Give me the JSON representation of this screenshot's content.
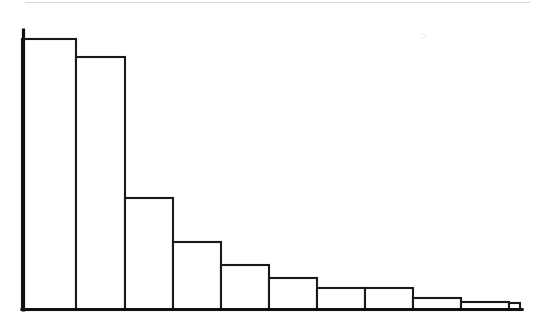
{
  "figure": {
    "title": "",
    "background_color": "#ffffff",
    "ink_color": "#1a1a1a",
    "axis_color": "#111111",
    "scan_artifact_color": "#d9d9d9",
    "width_px": 553,
    "height_px": 327
  },
  "axes": {
    "origin_x_px": 22,
    "baseline_y_px": 310,
    "y_axis_top_px": 30,
    "x_axis_right_px": 522,
    "x_axis_label": "",
    "y_axis_label": "",
    "tick_labels_x": [],
    "tick_labels_y": [],
    "grid": "off"
  },
  "chart_data": {
    "type": "bar",
    "title": "",
    "subtitle": "",
    "xlabel": "",
    "ylabel": "",
    "orientation": "vertical",
    "grid": false,
    "legend": "none",
    "bar_style": "outlined-unfilled",
    "categories": [
      "1",
      "2",
      "3",
      "4",
      "5",
      "6",
      "7",
      "8",
      "9",
      "10",
      "11"
    ],
    "values": [
      271,
      253,
      112,
      68,
      45,
      32,
      22,
      22,
      12,
      8,
      7
    ],
    "xlim": [
      0,
      11
    ],
    "ylim": [
      0,
      280
    ],
    "bar_edges_px": [
      22,
      76,
      125,
      173,
      221,
      269,
      317,
      365,
      413,
      461,
      509,
      520
    ],
    "bar_tops_px": [
      39,
      57,
      198,
      242,
      265,
      278,
      288,
      288,
      298,
      302,
      303
    ],
    "annotations": []
  },
  "artifacts": {
    "top_scan_line": {
      "name": "top-scan-line",
      "x1_px": 25,
      "x2_px": 530,
      "y_px": 2
    },
    "speck": {
      "name": "paper-speck",
      "x_px": 420,
      "y_px": 35,
      "r_px": 3
    }
  }
}
